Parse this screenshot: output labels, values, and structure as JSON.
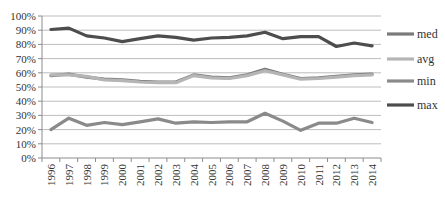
{
  "chart_data": {
    "type": "line",
    "title": "",
    "xlabel": "",
    "ylabel": "",
    "ylim": [
      0,
      100
    ],
    "y_ticks": [
      "0%",
      "10%",
      "20%",
      "30%",
      "40%",
      "50%",
      "60%",
      "70%",
      "80%",
      "90%",
      "100%"
    ],
    "grid": true,
    "legend_position": "right",
    "categories": [
      "1996",
      "1997",
      "1998",
      "1999",
      "2000",
      "2001",
      "2002",
      "2003",
      "2004",
      "2005",
      "2006",
      "2007",
      "2008",
      "2009",
      "2010",
      "2011",
      "2012",
      "2013",
      "2014"
    ],
    "series": [
      {
        "name": "med",
        "color": "#7a7a7a",
        "values": [
          58,
          59,
          57,
          55.5,
          55,
          54,
          53.5,
          53.5,
          58.5,
          57,
          56.5,
          58.5,
          62.5,
          59,
          56,
          56.5,
          57.5,
          58.5,
          59
        ]
      },
      {
        "name": "avg",
        "color": "#b5b5b5",
        "values": [
          58.5,
          58.5,
          57.5,
          55,
          54.5,
          53.5,
          53,
          53,
          58,
          56.5,
          56,
          58,
          61.5,
          58.5,
          55.5,
          56,
          57,
          58,
          58.5
        ]
      },
      {
        "name": "min",
        "color": "#8a8a8a",
        "values": [
          20,
          28,
          23,
          25,
          23.5,
          25.5,
          27.5,
          24.5,
          25.5,
          25,
          25.5,
          25.5,
          31.5,
          26,
          19.5,
          24.5,
          24.5,
          28,
          25
        ]
      },
      {
        "name": "max",
        "color": "#4d4d4d",
        "values": [
          90.5,
          91.5,
          86,
          84.5,
          82,
          84,
          86,
          85,
          83,
          84.5,
          85,
          86,
          88.5,
          84,
          85.5,
          85.5,
          78.5,
          81,
          79
        ]
      }
    ],
    "legend": [
      {
        "label": "med",
        "color": "#7a7a7a"
      },
      {
        "label": "avg",
        "color": "#b5b5b5"
      },
      {
        "label": "min",
        "color": "#8a8a8a"
      },
      {
        "label": "max",
        "color": "#4d4d4d"
      }
    ]
  },
  "layout_colors": {
    "gridline": "#bdbdbd",
    "axis": "#8c8c8c",
    "text": "#333333"
  }
}
